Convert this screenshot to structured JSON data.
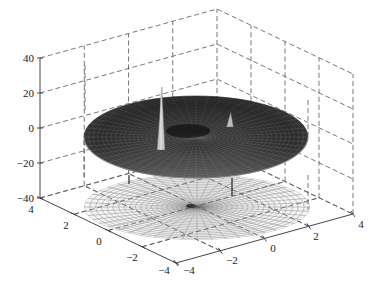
{
  "chart_data": {
    "type": "surface3d",
    "title": "",
    "xlabel": "",
    "ylabel": "",
    "zlabel": "",
    "x_ticks": [
      -4,
      -2,
      0,
      2,
      4
    ],
    "y_ticks": [
      -4,
      -2,
      0,
      2,
      4
    ],
    "z_ticks": [
      -40,
      -20,
      0,
      20,
      40
    ],
    "xlim": [
      -4,
      4
    ],
    "ylim": [
      -4,
      4
    ],
    "zlim": [
      -40,
      40
    ],
    "grid": true,
    "box": "dashed",
    "surfaces": [
      {
        "name": "mesh surface (polar disc)",
        "z_level": 0,
        "radius": 4,
        "style": "dark filled mesh",
        "features": [
          {
            "type": "spike",
            "x": -2,
            "y": 0.5,
            "peak_z": 36
          },
          {
            "type": "spike",
            "x": 1,
            "y": 1.5,
            "peak_z": 14
          },
          {
            "type": "spike",
            "x": -1.5,
            "y": -1,
            "peak_z": -8
          },
          {
            "type": "spike",
            "x": 1.3,
            "y": -1.2,
            "peak_z": -22
          }
        ]
      },
      {
        "name": "contour projection (polar mesh)",
        "z_level": -40,
        "radius": 4,
        "style": "light wireframe"
      }
    ]
  },
  "labels": {
    "z": [
      "40",
      "20",
      "0",
      "−20",
      "−40"
    ],
    "left_axis": [
      "4",
      "2",
      "0",
      "−2",
      "−4"
    ],
    "right_axis": [
      "−4",
      "−2",
      "0",
      "2",
      "4"
    ]
  },
  "colors": {
    "surface_dark": "#2e2e2e",
    "surface_mid": "#6a6a6a",
    "mesh_light": "#9a9a9a",
    "grid": "#555555"
  }
}
